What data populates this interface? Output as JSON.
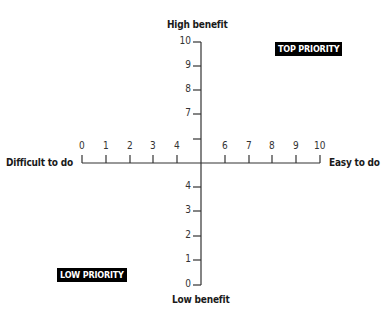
{
  "diagram": {
    "type": "priority-matrix",
    "y_axis": {
      "top_label": "High benefit",
      "bottom_label": "Low benefit",
      "ticks": [
        {
          "value": 10,
          "label": "10",
          "y": 42
        },
        {
          "value": 9,
          "label": "9",
          "y": 66
        },
        {
          "value": 8,
          "label": "8",
          "y": 90
        },
        {
          "value": 7,
          "label": "7",
          "y": 114
        },
        {
          "value": 6,
          "label": "",
          "y": 139
        },
        {
          "value": 4,
          "label": "4",
          "y": 187
        },
        {
          "value": 3,
          "label": "3",
          "y": 211
        },
        {
          "value": 2,
          "label": "2",
          "y": 236
        },
        {
          "value": 1,
          "label": "1",
          "y": 260
        },
        {
          "value": 0,
          "label": "0",
          "y": 285
        }
      ]
    },
    "x_axis": {
      "left_label": "Difficult to do",
      "right_label": "Easy to do",
      "ticks": [
        {
          "value": 0,
          "label": "0",
          "x": 82
        },
        {
          "value": 1,
          "label": "1",
          "x": 106
        },
        {
          "value": 2,
          "label": "2",
          "x": 130
        },
        {
          "value": 3,
          "label": "3",
          "x": 153
        },
        {
          "value": 4,
          "label": "4",
          "x": 177
        },
        {
          "value": 6,
          "label": "6",
          "x": 225
        },
        {
          "value": 7,
          "label": "7",
          "x": 249
        },
        {
          "value": 8,
          "label": "8",
          "x": 272
        },
        {
          "value": 9,
          "label": "9",
          "x": 296
        },
        {
          "value": 10,
          "label": "10",
          "x": 320
        }
      ]
    },
    "quadrant_labels": {
      "top_right": "TOP PRIORITY",
      "bottom_left": "LOW PRIORITY"
    },
    "colors": {
      "axis": "#333333",
      "badge_bg": "#000000",
      "badge_text": "#ffffff"
    }
  }
}
